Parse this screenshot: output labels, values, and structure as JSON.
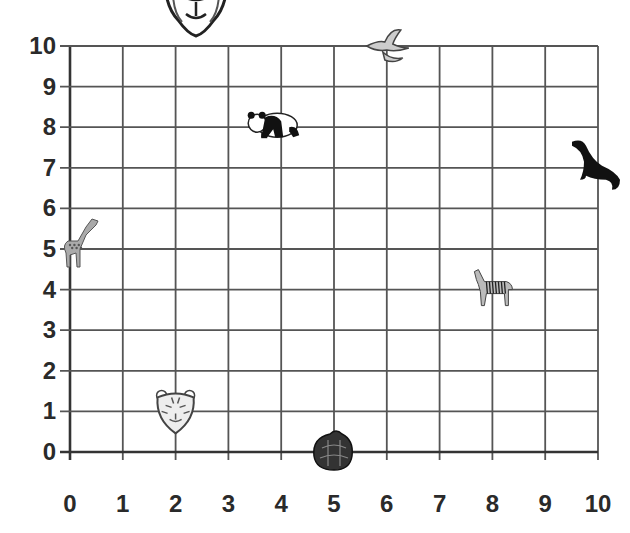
{
  "chart_data": {
    "type": "scatter",
    "title": "",
    "xlabel": "",
    "ylabel": "",
    "xlim": [
      0,
      10
    ],
    "ylim": [
      0,
      10
    ],
    "grid": true,
    "x_ticks": [
      "0",
      "1",
      "2",
      "3",
      "4",
      "5",
      "6",
      "7",
      "8",
      "9",
      "10"
    ],
    "y_ticks": [
      "0",
      "1",
      "2",
      "3",
      "4",
      "5",
      "6",
      "7",
      "8",
      "9",
      "10"
    ],
    "points": [
      {
        "name": "lion",
        "x": 3.5,
        "y": 11,
        "note": "partially cropped above grid"
      },
      {
        "name": "bird",
        "x": 6,
        "y": 10
      },
      {
        "name": "panda",
        "x": 4,
        "y": 8
      },
      {
        "name": "seal",
        "x": 10,
        "y": 7
      },
      {
        "name": "giraffe",
        "x": 0,
        "y": 5
      },
      {
        "name": "zebra",
        "x": 8,
        "y": 4
      },
      {
        "name": "tiger",
        "x": 2,
        "y": 1
      },
      {
        "name": "turtle",
        "x": 5,
        "y": 0
      }
    ]
  },
  "colors": {
    "grid": "#555555",
    "axis": "#333333",
    "label": "#2a2a2a",
    "background": "#ffffff"
  }
}
